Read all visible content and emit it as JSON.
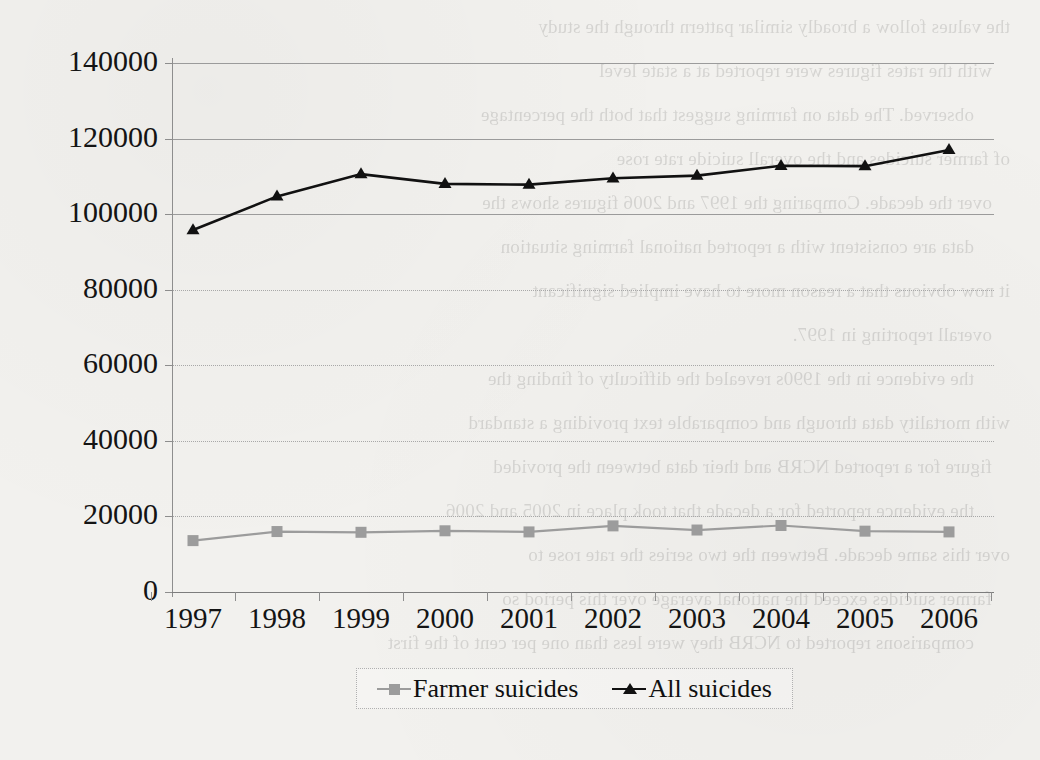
{
  "chart_data": {
    "type": "line",
    "title": "",
    "xlabel": "",
    "ylabel": "",
    "categories": [
      "1997",
      "1998",
      "1999",
      "2000",
      "2001",
      "2002",
      "2003",
      "2004",
      "2005",
      "2006"
    ],
    "ylim": [
      0,
      140000
    ],
    "ytick_step": 20000,
    "yticks": [
      "0",
      "20000",
      "40000",
      "60000",
      "80000",
      "100000",
      "120000",
      "140000"
    ],
    "grid": true,
    "legend_position": "bottom",
    "series": [
      {
        "name": "Farmer suicides",
        "marker": "square",
        "color": "#9c9c9c",
        "values": [
          13600,
          16000,
          15800,
          16200,
          15900,
          17500,
          16400,
          17600,
          16100,
          15900
        ]
      },
      {
        "name": "All suicides",
        "marker": "triangle",
        "color": "#111111",
        "values": [
          95800,
          104700,
          110600,
          108000,
          107800,
          109500,
          110200,
          112800,
          112700,
          117000
        ]
      }
    ]
  },
  "legend": {
    "items": [
      {
        "label": "Farmer suicides"
      },
      {
        "label": "All suicides"
      }
    ]
  },
  "page_background": {
    "ghost_lines": [
      "the values follow a broadly similar pattern through the study",
      "with the rates figures were reported at a state level",
      "observed. The data on farming suggest that both the percentage",
      "of farmer suicides and the overall suicide rate rose",
      "over the decade. Comparing the 1997 and 2006 figures shows the",
      "data are consistent with a reported national farming situation",
      "it now obvious that a reason more to have implied significant",
      "overall reporting in 1997.",
      "the evidence in the 1990s revealed the difficulty of finding the",
      "with mortality data through and comparable text providing a standard",
      "figure for a reported NCRB and their data between the provided",
      "the evidence reported for a decade that took place in 2005 and 2006",
      "over this same decade. Between the two series the rate rose to",
      "farmer suicides exceed the national average over this period so",
      "comparisons reported to NCRB they were less than one per cent of the first"
    ]
  }
}
